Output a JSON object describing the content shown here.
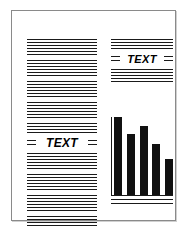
{
  "document": {
    "title": "Page layout preview",
    "background_color": "#ffffff",
    "border_color": "#8a8a8a",
    "ink_color": "#1a1a1a"
  },
  "columns": {
    "left": {
      "name": "left-text-column",
      "label": "TEXT",
      "lines_above_label": 28,
      "lines_below_label": 22
    },
    "right": {
      "name": "right-text-column",
      "label": "TEXT",
      "lines_above_label": 4,
      "lines_below_label": 5
    }
  },
  "chart_data": {
    "type": "bar",
    "title": "",
    "xlabel": "",
    "ylabel": "",
    "categories": [
      "1",
      "2",
      "3",
      "4",
      "5"
    ],
    "values": [
      100,
      78,
      88,
      66,
      46
    ],
    "ylim": [
      0,
      100
    ],
    "grid": false,
    "legend": false,
    "bar_color": "#111111",
    "axis_color": "#1a1a1a"
  },
  "chart_footer_rules": 2
}
